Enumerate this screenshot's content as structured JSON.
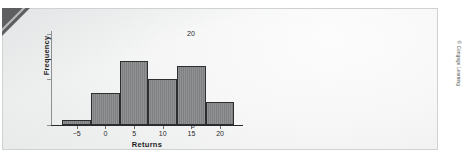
{
  "figure": {
    "copyright": "© Cengage Learning",
    "panel_bg": "#f2f3f3",
    "panel_border": "#cfd1d2",
    "bar_fill": "#848687",
    "bar_edge": "#2d2e2f",
    "corner_fold_color": "#5d5f60"
  },
  "chart_data": {
    "type": "bar",
    "title": "",
    "subtitle": "",
    "xlabel": "Returns",
    "ylabel": "Frequency",
    "categories": [
      "-7.5 to -2.5",
      "-2.5 to 2.5",
      "2.5 to 7.5",
      "7.5 to 12.5",
      "12.5 to 17.5",
      "17.5 to 22.5"
    ],
    "bin_edges": [
      -7.5,
      -2.5,
      2.5,
      7.5,
      12.5,
      17.5,
      22.5
    ],
    "bin_width": 5,
    "values": [
      1,
      7,
      14,
      10,
      13,
      5
    ],
    "xlim": [
      -9.5,
      24
    ],
    "ylim": [
      0,
      21
    ],
    "xticks": [
      -5,
      0,
      5,
      10,
      15,
      20
    ],
    "xtick_labels": [
      "−5",
      "0",
      "5",
      "10",
      "15",
      "20"
    ],
    "yticks": [
      0,
      10,
      20
    ],
    "ytick_labels": [
      "0",
      "10",
      "20"
    ],
    "grid": false,
    "legend": null,
    "annotations": []
  }
}
